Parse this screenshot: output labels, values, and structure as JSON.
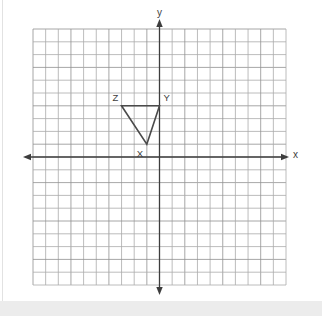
{
  "figure": {
    "type": "coordinate-plane",
    "axis_labels": {
      "x": "x",
      "y": "y"
    },
    "grid": {
      "x_range": [
        -10,
        10
      ],
      "y_range": [
        -10,
        10
      ],
      "cells": 20
    },
    "triangle": {
      "name": "XYZ",
      "vertices": [
        {
          "label": "X",
          "x": -1,
          "y": 1
        },
        {
          "label": "Y",
          "x": 0,
          "y": 4
        },
        {
          "label": "Z",
          "x": -3,
          "y": 4
        }
      ]
    },
    "colors": {
      "background": "#ffffff",
      "grid_line": "#ababab",
      "grid_line_dark": "#919191",
      "axis": "#3d3d3d",
      "triangle": "#4a4a4a",
      "label_text": "#3d3d3d",
      "page_strip": "#ececec",
      "edge_line": "#e2e2e2"
    }
  }
}
